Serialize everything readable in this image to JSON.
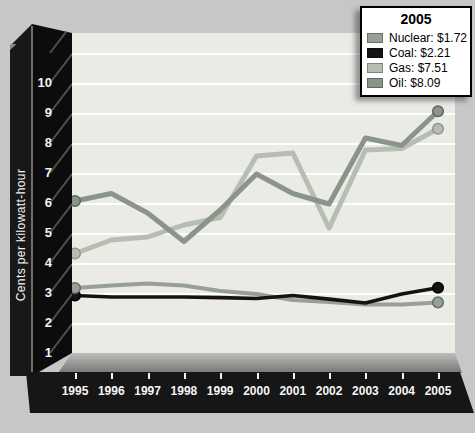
{
  "y_axis": {
    "label": "Cents per kilowatt-hour",
    "tick_labels": [
      "0",
      "1",
      "2",
      "3",
      "4",
      "5",
      "6",
      "7",
      "8",
      "9",
      "10"
    ]
  },
  "legend": {
    "title": "2005",
    "entries": [
      {
        "name": "Nuclear",
        "label": "Nuclear: $1.72",
        "color": "#96a096"
      },
      {
        "name": "Coal",
        "label": "Coal: $2.21",
        "color": "#131313"
      },
      {
        "name": "Gas",
        "label": "Gas: $7.51",
        "color": "#b6beb4"
      },
      {
        "name": "Oil",
        "label": "Oil: $8.09",
        "color": "#8b948b"
      }
    ]
  },
  "colors": {
    "background": "#c7c7c7",
    "plot_background": "#ebebe6",
    "gridline": "#ffffff",
    "axis_frame": "#101010",
    "axis_text": "#f2f2f2"
  },
  "chart_data": {
    "type": "line",
    "title": "",
    "ylabel": "Cents per kilowatt-hour",
    "x": [
      1995,
      1996,
      1997,
      1998,
      1999,
      2000,
      2001,
      2002,
      2003,
      2004,
      2005
    ],
    "ylim": [
      0,
      10.7
    ],
    "yticks": [
      0,
      1,
      2,
      3,
      4,
      5,
      6,
      7,
      8,
      9,
      10
    ],
    "gridlines": [
      1,
      2,
      3,
      4,
      5,
      6,
      7,
      8,
      9,
      10
    ],
    "grid": "horizontal-white",
    "legend_position": "top-right",
    "legend_title": "2005",
    "series": [
      {
        "name": "Nuclear",
        "values": [
          2.2,
          2.28,
          2.35,
          2.28,
          2.1,
          2.0,
          1.8,
          1.73,
          1.65,
          1.65,
          1.72
        ],
        "color": "#96a096",
        "marker_stroke": "#657165",
        "stroke_width": 4,
        "value_2005_label": "$1.72"
      },
      {
        "name": "Coal",
        "values": [
          1.95,
          1.9,
          1.9,
          1.9,
          1.88,
          1.85,
          1.95,
          1.83,
          1.7,
          2.0,
          2.21
        ],
        "color": "#131313",
        "marker_stroke": "#000000",
        "stroke_width": 3.6,
        "value_2005_label": "$2.21"
      },
      {
        "name": "Gas",
        "values": [
          3.35,
          3.8,
          3.9,
          4.3,
          4.55,
          6.6,
          6.7,
          4.2,
          6.8,
          6.85,
          7.51
        ],
        "color": "#b6beb4",
        "marker_stroke": "#8d958b",
        "stroke_width": 5,
        "value_2005_label": "$7.51"
      },
      {
        "name": "Oil",
        "values": [
          5.1,
          5.35,
          4.7,
          3.75,
          4.8,
          6.0,
          5.35,
          5.0,
          7.2,
          6.95,
          8.09
        ],
        "color": "#8b948b",
        "marker_stroke": "#5d665d",
        "stroke_width": 5,
        "value_2005_label": "$8.09"
      }
    ],
    "draw_order": [
      2,
      3,
      0,
      1
    ],
    "marker_draw_order": [
      1,
      0,
      2,
      3
    ],
    "markers_at_x": [
      1995,
      2005
    ]
  }
}
